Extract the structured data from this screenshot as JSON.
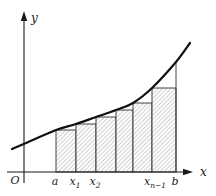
{
  "figure": {
    "type": "riemann-lower-sum-diagram",
    "background": "#ffffff",
    "colors": {
      "ink": "#1a1a1a",
      "curve": "#111111",
      "rect_stroke": "#2f2f2f",
      "hatch": "#8f8f8f"
    },
    "axes": {
      "y": {
        "label": "y",
        "x": 24,
        "top": 12,
        "bottom": 183
      },
      "x": {
        "label": "x",
        "y": 172,
        "left": 7,
        "right": 193
      },
      "origin_label": "O"
    },
    "rects": [
      {
        "x0": 56,
        "x1": 76,
        "top": 130
      },
      {
        "x0": 76,
        "x1": 96,
        "top": 124
      },
      {
        "x0": 96,
        "x1": 116,
        "top": 117
      },
      {
        "x0": 116,
        "x1": 133,
        "top": 110
      },
      {
        "x0": 133,
        "x1": 152,
        "top": 103
      },
      {
        "x0": 152,
        "x1": 176,
        "top": 88
      }
    ],
    "curve_points": [
      [
        12,
        149
      ],
      [
        26,
        143
      ],
      [
        56,
        130
      ],
      [
        76,
        124
      ],
      [
        96,
        117
      ],
      [
        116,
        110
      ],
      [
        133,
        103
      ],
      [
        152,
        88
      ],
      [
        176,
        62
      ],
      [
        190,
        43
      ]
    ],
    "b_vertical_line": {
      "x": 176,
      "y0": 62,
      "y1": 172
    },
    "ticks": [
      {
        "base": "a",
        "sub": "",
        "x": 55
      },
      {
        "base": "x",
        "sub": "1",
        "x": 75
      },
      {
        "base": "x",
        "sub": "2",
        "x": 95
      },
      {
        "base": "x",
        "sub": "n−1",
        "x": 155
      },
      {
        "base": "b",
        "sub": "",
        "x": 175
      }
    ],
    "tick_baseline_y": 185,
    "origin_pos": {
      "x": 15,
      "y": 184
    },
    "y_label_pos": {
      "x": 31,
      "y": 22
    },
    "x_label_pos": {
      "x": 200,
      "y": 176
    }
  }
}
